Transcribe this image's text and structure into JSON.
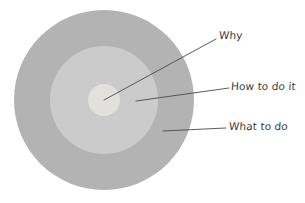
{
  "diagram": {
    "type": "concentric-circles",
    "title": "",
    "background_color": "#ffffff",
    "center": {
      "x": 104,
      "y": 100
    },
    "rings": [
      {
        "id": "outer",
        "label": "What to do",
        "radius": 90,
        "fill_color": "#b5b5b5"
      },
      {
        "id": "middle",
        "label": "How to do it",
        "radius": 54,
        "fill_color": "#cdcdcd"
      },
      {
        "id": "inner",
        "label": "Why",
        "radius": 16,
        "fill_color": "#e4e3df"
      }
    ],
    "leader_lines": [
      {
        "id": "why-leader",
        "x1": 104,
        "y1": 100,
        "x2": 216,
        "y2": 39,
        "color": "#4a4a4a"
      },
      {
        "id": "how-leader",
        "x1": 136,
        "y1": 101,
        "x2": 229,
        "y2": 88,
        "color": "#4a4a4a"
      },
      {
        "id": "what-leader",
        "x1": 163,
        "y1": 131,
        "x2": 226,
        "y2": 128,
        "color": "#4a4a4a"
      }
    ],
    "labels": {
      "why": "Why",
      "how_to_do_it": "How to do it",
      "what_to_do": "What to do"
    },
    "label_color": "#3a3a3a"
  }
}
